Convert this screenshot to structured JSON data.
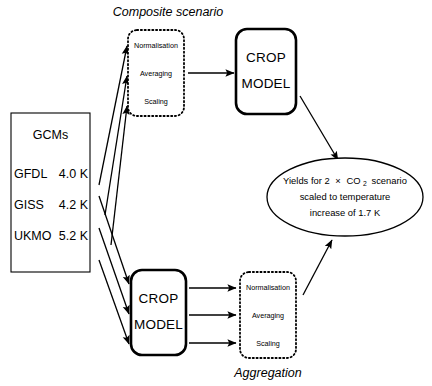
{
  "diagram": {
    "title_top": "Composite scenario",
    "title_bottom": "Aggregation",
    "gcms": {
      "heading": "GCMs",
      "rows": [
        {
          "name": "GFDL",
          "value": "4.0 K"
        },
        {
          "name": "GISS",
          "value": "4.2 K"
        },
        {
          "name": "UKMO",
          "value": "5.2 K"
        }
      ]
    },
    "composite_stages": {
      "stage1": "Normalisation",
      "stage2": "Averaging",
      "stage3": "Scaling"
    },
    "aggregation_stages": {
      "stage1": "Normalisation",
      "stage2": "Averaging",
      "stage3": "Scaling"
    },
    "crop_model_top": {
      "line1": "CROP",
      "line2": "MODEL"
    },
    "crop_model_bottom": {
      "line1": "CROP",
      "line2": "MODEL"
    },
    "result": {
      "line1_a": "Yields for 2",
      "line1_b": "×",
      "line1_c": "CO",
      "line1_sub": "2",
      "line1_d": "scenario",
      "line2": "scaled to temperature",
      "line3": "increase of 1.7 K"
    },
    "colors": {
      "stroke": "#000000",
      "background": "#ffffff"
    }
  }
}
